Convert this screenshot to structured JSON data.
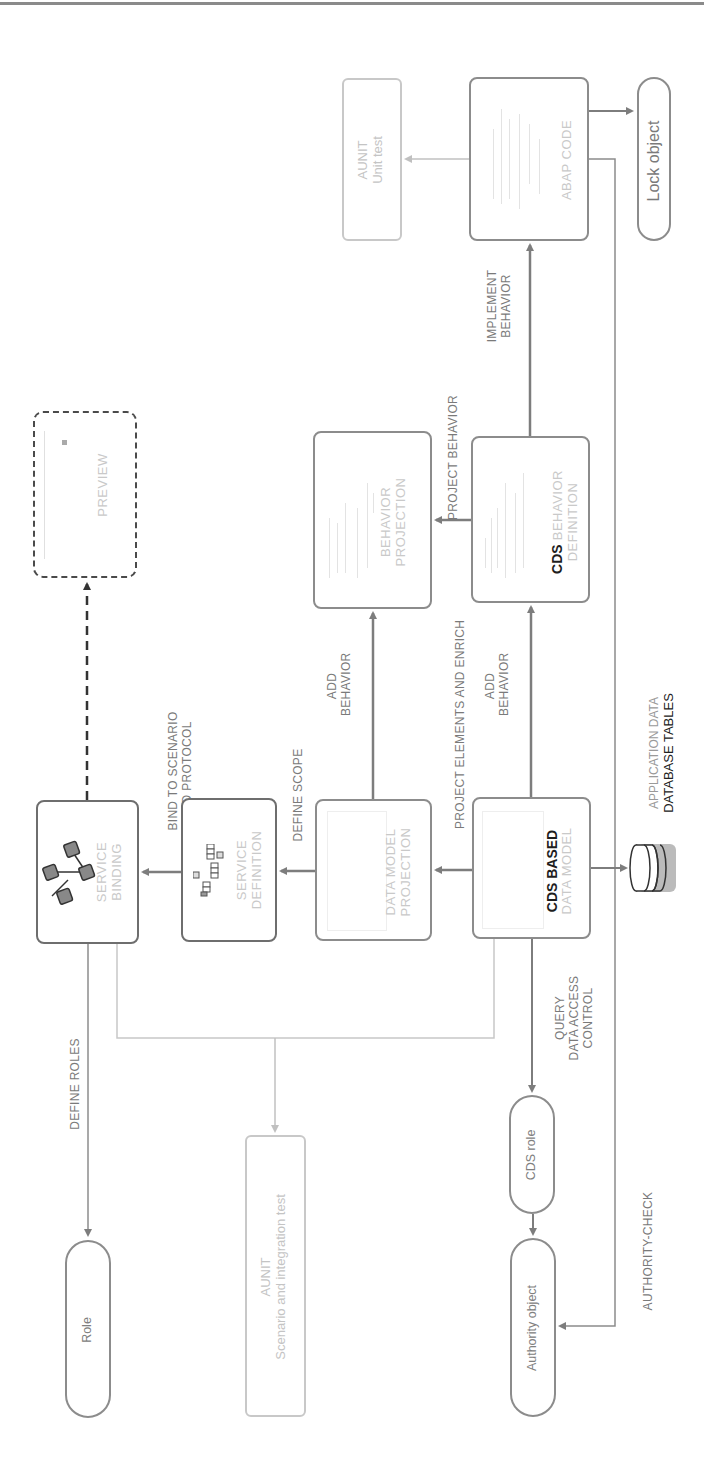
{
  "diagram": {
    "orientation": "rotated-90-ccw",
    "nodes": {
      "aunit_unit_test": {
        "line1": "AUNIT",
        "line2": "Unit test"
      },
      "abap_code": {
        "label": "ABAP CODE"
      },
      "lock_object": {
        "label": "Lock object"
      },
      "preview": {
        "label": "PREVIEW"
      },
      "behavior_projection": {
        "line1": "BEHAVIOR",
        "line2": "PROJECTION"
      },
      "cds_behavior_definition": {
        "bold": "CDS",
        "rest": " BEHAVIOR",
        "line2": "DEFINITION"
      },
      "service_binding": {
        "line1": "SERVICE",
        "line2": "BINDING"
      },
      "service_definition": {
        "line1": "SERVICE",
        "line2": "DEFINITION"
      },
      "data_model_projection": {
        "line1": "DATA MODEL",
        "line2": "PROJECTION"
      },
      "cds_based_data_model": {
        "line1": "CDS BASED",
        "line2": "DATA MODEL"
      },
      "database_tables": {
        "line1": "APPLICATION DATA",
        "line2": "DATABASE TABLES"
      },
      "role": {
        "label": "Role"
      },
      "aunit_scenario": {
        "line1": "AUNIT",
        "line2": "Scenario and integration test"
      },
      "cds_role": {
        "label": "CDS role"
      },
      "authority_object": {
        "label": "Authority object"
      }
    },
    "edges": {
      "implement_behavior": {
        "line1": "IMPLEMENT",
        "line2": "BEHAVIOR"
      },
      "project_behavior": {
        "label": "PROJECT BEHAVIOR"
      },
      "add_behavior_1": {
        "line1": "ADD",
        "line2": "BEHAVIOR"
      },
      "add_behavior_2": {
        "line1": "ADD",
        "line2": "BEHAVIOR"
      },
      "project_elements": {
        "label": "PROJECT ELEMENTS AND ENRICH"
      },
      "define_scope": {
        "label": "DEFINE SCOPE"
      },
      "bind_to_scenario": {
        "line1": "BIND TO SCENARIO",
        "line2": "AND PROTOCOL"
      },
      "define_roles": {
        "label": "DEFINE ROLES"
      },
      "query_dac": {
        "line1": "QUERY",
        "line2": "DATA ACCESS",
        "line3": "CONTROL"
      },
      "authority_check": {
        "label": "AUTHORITY-CHECK"
      }
    },
    "colors": {
      "line": "#8c8c8c",
      "light_line": "#c8c8c8",
      "dashed": "#4a4a4a",
      "dark_text": "#1e1e1e",
      "light_text": "#c9c9c9"
    }
  }
}
